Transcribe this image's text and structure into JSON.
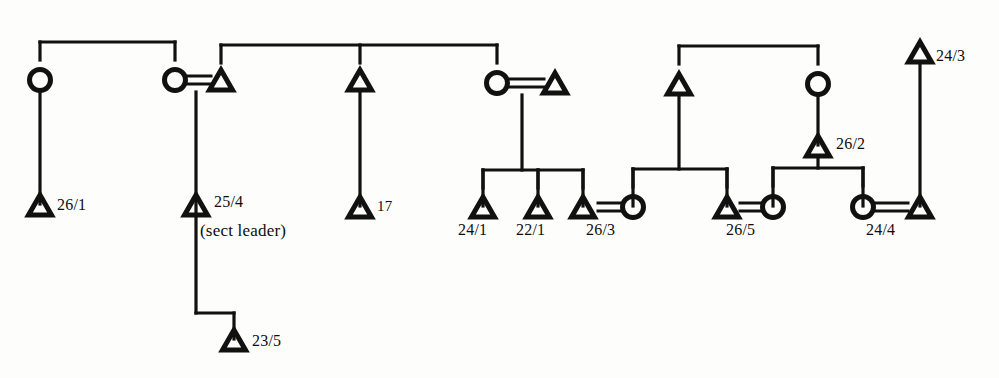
{
  "diagram": {
    "symbol_legend": {
      "triangle": "male",
      "circle": "female",
      "equals": "marriage link",
      "vertical_line": "descent link",
      "horizontal_bar": "sibling bar"
    },
    "ink_color": "#111111",
    "background_color": "#fdfdfb",
    "stroke_width": 3.2
  },
  "nodes": [
    {
      "id": "n1",
      "shape": "circle",
      "x": 40,
      "y": 80,
      "label": ""
    },
    {
      "id": "n2",
      "shape": "circle",
      "x": 175,
      "y": 80,
      "label": ""
    },
    {
      "id": "n3",
      "shape": "triangle",
      "x": 221,
      "y": 80,
      "label": ""
    },
    {
      "id": "n4",
      "shape": "triangle",
      "x": 360,
      "y": 80,
      "label": ""
    },
    {
      "id": "n5",
      "shape": "circle",
      "x": 497,
      "y": 83,
      "label": ""
    },
    {
      "id": "n6",
      "shape": "triangle",
      "x": 555,
      "y": 83,
      "label": ""
    },
    {
      "id": "n7",
      "shape": "triangle",
      "x": 679,
      "y": 84,
      "label": ""
    },
    {
      "id": "n8",
      "shape": "circle",
      "x": 818,
      "y": 84,
      "label": ""
    },
    {
      "id": "n9",
      "shape": "triangle",
      "x": 920,
      "y": 52,
      "label": "24/3"
    },
    {
      "id": "n10",
      "shape": "triangle",
      "x": 818,
      "y": 146,
      "label": "26/2"
    },
    {
      "id": "n11",
      "shape": "triangle",
      "x": 40,
      "y": 205,
      "label": "26/1"
    },
    {
      "id": "n12",
      "shape": "triangle",
      "x": 196,
      "y": 205,
      "label": "25/4"
    },
    {
      "id": "n13",
      "shape": "triangle",
      "x": 360,
      "y": 207,
      "label": "17"
    },
    {
      "id": "n14",
      "shape": "triangle",
      "x": 483,
      "y": 207,
      "label": "24/1"
    },
    {
      "id": "n15",
      "shape": "triangle",
      "x": 538,
      "y": 207,
      "label": "22/1"
    },
    {
      "id": "n16",
      "shape": "triangle",
      "x": 583,
      "y": 207,
      "label": "26/3"
    },
    {
      "id": "n17",
      "shape": "circle",
      "x": 633,
      "y": 207,
      "label": ""
    },
    {
      "id": "n18",
      "shape": "triangle",
      "x": 727,
      "y": 207,
      "label": "26/5"
    },
    {
      "id": "n19",
      "shape": "circle",
      "x": 773,
      "y": 207,
      "label": ""
    },
    {
      "id": "n20",
      "shape": "circle",
      "x": 863,
      "y": 207,
      "label": ""
    },
    {
      "id": "n21",
      "shape": "triangle",
      "x": 920,
      "y": 207,
      "label": "24/4"
    },
    {
      "id": "n22",
      "shape": "triangle",
      "x": 234,
      "y": 340,
      "label": "23/5"
    }
  ],
  "labels": [
    {
      "id": "l1",
      "text": "26/1",
      "x": 57,
      "y": 197,
      "size": "small"
    },
    {
      "id": "l2",
      "text": "25/4",
      "x": 214,
      "y": 194,
      "size": "small"
    },
    {
      "id": "l3",
      "text": "(sect leader)",
      "x": 200,
      "y": 222,
      "size": "note"
    },
    {
      "id": "l4",
      "text": "17",
      "x": 377,
      "y": 199,
      "size": "tiny"
    },
    {
      "id": "l5",
      "text": "24/1",
      "x": 458,
      "y": 222,
      "size": "small"
    },
    {
      "id": "l6",
      "text": "22/1",
      "x": 516,
      "y": 222,
      "size": "small"
    },
    {
      "id": "l7",
      "text": "26/3",
      "x": 586,
      "y": 222,
      "size": "small"
    },
    {
      "id": "l8",
      "text": "26/5",
      "x": 726,
      "y": 222,
      "size": "small"
    },
    {
      "id": "l9",
      "text": "24/4",
      "x": 866,
      "y": 222,
      "size": "small"
    },
    {
      "id": "l10",
      "text": "26/2",
      "x": 836,
      "y": 136,
      "size": "small"
    },
    {
      "id": "l11",
      "text": "24/3",
      "x": 936,
      "y": 48,
      "size": "small"
    },
    {
      "id": "l12",
      "text": "23/5",
      "x": 252,
      "y": 333,
      "size": "small"
    }
  ],
  "marriages": [
    {
      "id": "m1",
      "left": "n2",
      "right": "n3",
      "x1": 188,
      "x2": 211,
      "y": 80
    },
    {
      "id": "m2",
      "left": "n5",
      "right": "n6",
      "x1": 510,
      "x2": 544,
      "y": 83
    },
    {
      "id": "m3",
      "left": "n16",
      "right": "n17",
      "x1": 598,
      "x2": 622,
      "y": 207
    },
    {
      "id": "m4",
      "left": "n18",
      "right": "n19",
      "x1": 740,
      "x2": 762,
      "y": 207
    },
    {
      "id": "m5",
      "left": "n20",
      "right": "n21",
      "x1": 876,
      "x2": 908,
      "y": 207
    }
  ],
  "sibling_bars": [
    {
      "id": "b1",
      "y": 42,
      "x1": 40,
      "x2": 175,
      "children_x": [
        40,
        175
      ]
    },
    {
      "id": "b2",
      "y": 45,
      "x1": 221,
      "x2": 497,
      "children_x": [
        221,
        360,
        497
      ]
    },
    {
      "id": "b3",
      "y": 46,
      "x1": 679,
      "x2": 818,
      "children_x": [
        679,
        818
      ]
    },
    {
      "id": "b4",
      "y": 170,
      "x1": 483,
      "x2": 583,
      "children_x": [
        483,
        538,
        583
      ]
    },
    {
      "id": "b5",
      "y": 169,
      "x1": 633,
      "x2": 727,
      "children_x": [
        633,
        727
      ]
    },
    {
      "id": "b6",
      "y": 168,
      "x1": 773,
      "x2": 863,
      "children_x": [
        773,
        863
      ]
    }
  ],
  "descent_lines": [
    {
      "id": "d1",
      "x": 40,
      "y1": 92,
      "y2": 204
    },
    {
      "id": "d2",
      "x": 196,
      "y1": 92,
      "y2": 313
    },
    {
      "id": "d3",
      "x": 360,
      "y1": 92,
      "y2": 206
    },
    {
      "id": "d4",
      "x": 522,
      "y1": 95,
      "y2": 170
    },
    {
      "id": "d5",
      "x": 679,
      "y1": 96,
      "y2": 169
    },
    {
      "id": "d6",
      "x": 818,
      "y1": 96,
      "y2": 145
    },
    {
      "id": "d7",
      "x": 818,
      "y1": 156,
      "y2": 168
    },
    {
      "id": "d8",
      "x": 920,
      "y1": 64,
      "y2": 206
    },
    {
      "id": "d9",
      "x": 483,
      "y1": 170,
      "y2": 206
    },
    {
      "id": "d10",
      "x": 538,
      "y1": 170,
      "y2": 206
    },
    {
      "id": "d11",
      "x": 583,
      "y1": 170,
      "y2": 206
    },
    {
      "id": "d12",
      "x": 633,
      "y1": 169,
      "y2": 206
    },
    {
      "id": "d13",
      "x": 727,
      "y1": 169,
      "y2": 206
    },
    {
      "id": "d14",
      "x": 773,
      "y1": 168,
      "y2": 206
    },
    {
      "id": "d15",
      "x": 863,
      "y1": 168,
      "y2": 206
    },
    {
      "id": "d16",
      "x": 234,
      "y1": 313,
      "y2": 339
    }
  ],
  "step_connectors": [
    {
      "id": "s1",
      "from_x": 196,
      "to_x": 234,
      "y": 313
    }
  ]
}
